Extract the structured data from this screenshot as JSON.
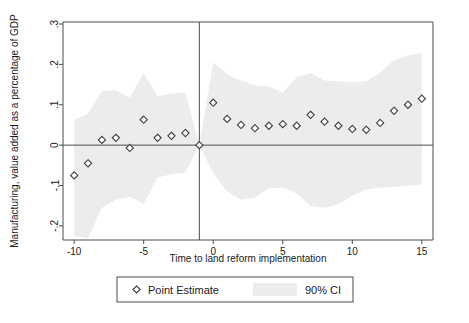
{
  "chart_data": {
    "type": "scatter",
    "title": "",
    "subtitle": "",
    "xlabel": "Time to land reform implementation",
    "ylabel": "Manufacturing, value added as a percentage of GDP",
    "xlim": [
      -10.8,
      15.8
    ],
    "ylim": [
      -0.235,
      0.305
    ],
    "xticks": [
      -10,
      -5,
      0,
      5,
      10,
      15
    ],
    "xticklabels": [
      "-10",
      "-5",
      "0",
      "5",
      "10",
      "15"
    ],
    "yticks": [
      -0.2,
      -0.1,
      0,
      0.1,
      0.2,
      0.3
    ],
    "yticklabels": [
      "-.2",
      "-.1",
      "0",
      ".1",
      ".2",
      ".3"
    ],
    "grid": false,
    "hline_at": 0,
    "vline_at": -1,
    "legend_position": "below-axis",
    "series": [
      {
        "name": "Point Estimate",
        "marker": "diamond",
        "x": [
          -10,
          -9,
          -8,
          -7,
          -6,
          -5,
          -4,
          -3,
          -2,
          -1,
          0,
          1,
          2,
          3,
          4,
          5,
          6,
          7,
          8,
          9,
          10,
          11,
          12,
          13,
          14,
          15
        ],
        "values": [
          -0.075,
          -0.045,
          0.013,
          0.018,
          -0.007,
          0.063,
          0.018,
          0.023,
          0.03,
          0.0,
          0.105,
          0.065,
          0.05,
          0.042,
          0.048,
          0.052,
          0.048,
          0.075,
          0.058,
          0.048,
          0.04,
          0.038,
          0.055,
          0.085,
          0.1,
          0.115
        ]
      },
      {
        "name": "90% CI",
        "type": "band",
        "x": [
          -10,
          -9,
          -8,
          -7,
          -6,
          -5,
          -4,
          -3,
          -2,
          -1,
          0,
          1,
          2,
          3,
          4,
          5,
          6,
          7,
          8,
          9,
          10,
          11,
          12,
          13,
          14,
          15
        ],
        "lower": [
          -0.225,
          -0.23,
          -0.155,
          -0.135,
          -0.128,
          -0.145,
          -0.08,
          -0.072,
          -0.068,
          0.0,
          -0.07,
          -0.115,
          -0.135,
          -0.13,
          -0.107,
          -0.105,
          -0.12,
          -0.15,
          -0.155,
          -0.147,
          -0.125,
          -0.11,
          -0.105,
          -0.103,
          -0.1,
          -0.098
        ],
        "upper": [
          0.062,
          0.078,
          0.135,
          0.136,
          0.118,
          0.178,
          0.122,
          0.128,
          0.13,
          0.0,
          0.205,
          0.175,
          0.16,
          0.148,
          0.145,
          0.13,
          0.168,
          0.178,
          0.16,
          0.158,
          0.155,
          0.158,
          0.18,
          0.21,
          0.222,
          0.228
        ]
      }
    ]
  },
  "legend": {
    "point_estimate_label": "Point Estimate",
    "ci_label": "90% CI"
  },
  "colors": {
    "ci_band": "#ececed",
    "marker_stroke": "#3c3c46",
    "marker_fill": "#ffffff",
    "axis": "#4d4d4d",
    "text": "#1a1a1a",
    "background": "#ffffff"
  }
}
